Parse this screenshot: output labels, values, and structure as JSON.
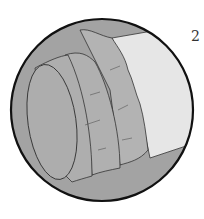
{
  "figure": {
    "step_number": "2",
    "colors": {
      "background": "#ffffff",
      "circle_fill": "#a3a3a3",
      "circle_border": "#111111",
      "pipe": "#e6e6e6",
      "fabric": "#b3b3b3",
      "end_cap": "#adadad",
      "line": "#333333"
    }
  }
}
